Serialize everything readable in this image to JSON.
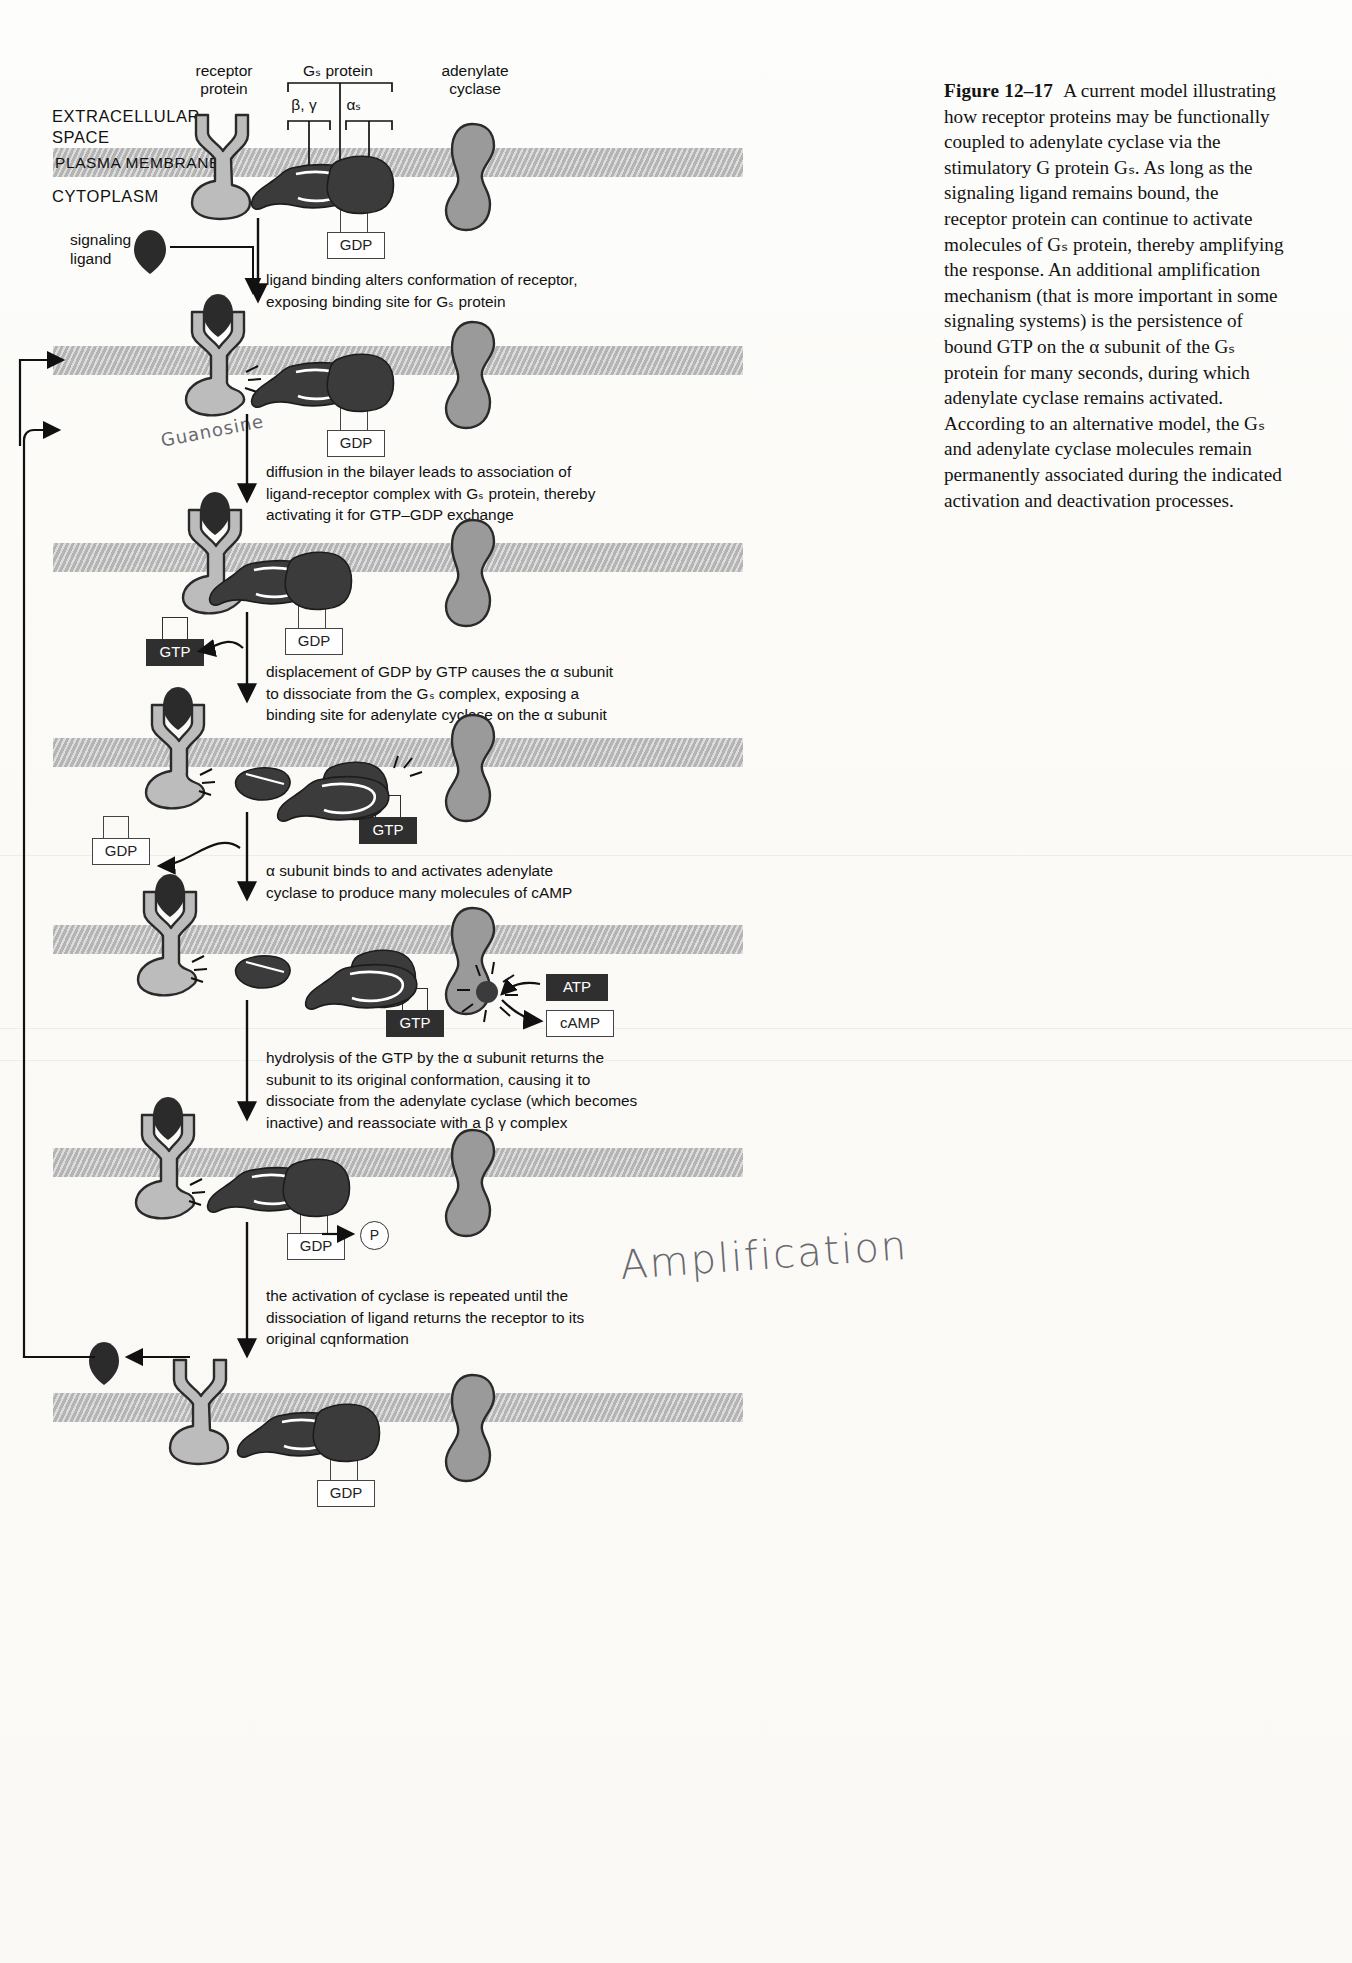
{
  "caption": {
    "figure_number": "Figure 12–17",
    "text": "A current model illustrating how receptor proteins may be functionally coupled to adenylate cyclase via the stimulatory G protein Gₛ. As long as the signaling ligand remains bound, the receptor protein can continue to activate molecules of Gₛ protein, thereby amplifying the response. An additional amplification mechanism (that is more important in some signaling systems) is the persistence of bound GTP on the α subunit of the Gₛ protein for many seconds, during which adenylate cyclase remains activated. According to an alternative model, the Gₛ and adenylate cyclase molecules remain permanently associated during the indicated activation and deactivation processes."
  },
  "top_labels": {
    "receptor": "receptor\nprotein",
    "gs_protein": "Gₛ protein",
    "beta_gamma": "β, γ",
    "alpha_s": "αₛ",
    "adenylate_cyclase": "adenylate\ncyclase"
  },
  "compartments": {
    "extracellular": "EXTRACELLULAR\nSPACE",
    "plasma_membrane": "PLASMA MEMBRANE",
    "cytoplasm": "CYTOPLASM"
  },
  "ligand_label": "signaling\nligand",
  "nucleotides": {
    "gdp": "GDP",
    "gtp": "GTP",
    "atp": "ATP",
    "camp": "cAMP",
    "phosphate": "P"
  },
  "steps": [
    {
      "id": "step-1",
      "text": "ligand binding alters conformation of receptor,\nexposing binding site for Gₛ protein"
    },
    {
      "id": "step-2",
      "text": "diffusion in the bilayer leads to association of\nligand-receptor complex with Gₛ protein, thereby\nactivating it for GTP–GDP exchange"
    },
    {
      "id": "step-3",
      "text": "displacement of GDP by GTP causes the α subunit\nto dissociate from the Gₛ complex, exposing a\nbinding site for adenylate cyclase on the α subunit"
    },
    {
      "id": "step-4",
      "text": "α subunit binds to and activates adenylate\ncyclase to produce many molecules of cAMP"
    },
    {
      "id": "step-5",
      "text": "hydrolysis of the GTP by the α subunit returns the\nsubunit to its original conformation, causing it to\ndissociate from the adenylate cyclase (which becomes\ninactive) and reassociate with a β γ complex"
    },
    {
      "id": "step-6",
      "text": "the activation of cyclase is repeated until the\ndissociation of ligand returns the receptor to its\noriginal cqnformation"
    }
  ],
  "handwriting": {
    "amplification": "Amplification",
    "guanosine": "Guanosine"
  },
  "colors": {
    "membrane": "#b4b4b4",
    "receptor": "#b9b9b9",
    "g_protein": "#3a3a3a",
    "cyclase": "#8e8e8e",
    "ligand": "#2b2b2b",
    "ink": "#111111"
  }
}
